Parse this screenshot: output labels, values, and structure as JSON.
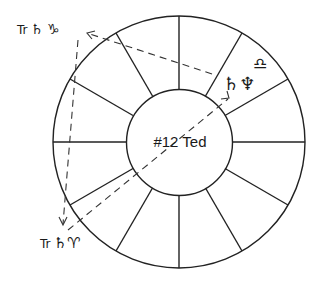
{
  "chart": {
    "title": "#12 Ted",
    "type": "astrological house wheel",
    "houses": 12
  },
  "labels": {
    "transit_top": {
      "prefix": "Tr",
      "planet": "♄",
      "sign": "♑"
    },
    "transit_bottom": {
      "prefix": "Tr",
      "planet": "♄",
      "sign": "♈"
    },
    "natal": {
      "planets": "♄♆",
      "sign": "♎"
    }
  },
  "colors": {
    "line": "#222222",
    "background": "#ffffff"
  }
}
